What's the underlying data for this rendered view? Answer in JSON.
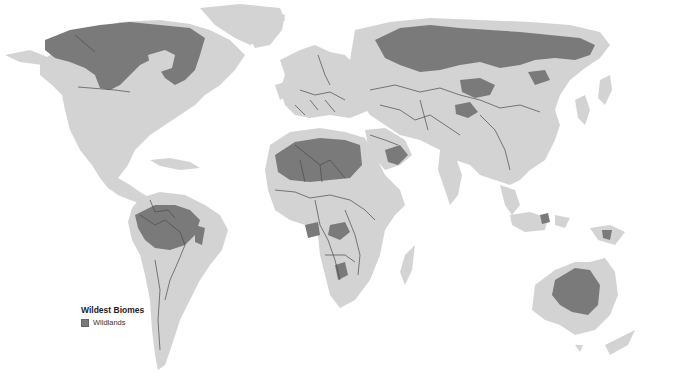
{
  "map": {
    "title": "Wildest Biomes",
    "projection": "world",
    "colors": {
      "background": "#ffffff",
      "land": "#d3d3d3",
      "wildlands": "#7a7a7a",
      "borders": "#4a4a4a"
    }
  },
  "legend": {
    "title": "Wildest Biomes",
    "items": [
      {
        "label": "Wildlands",
        "color": "#7a7a7a"
      }
    ]
  }
}
